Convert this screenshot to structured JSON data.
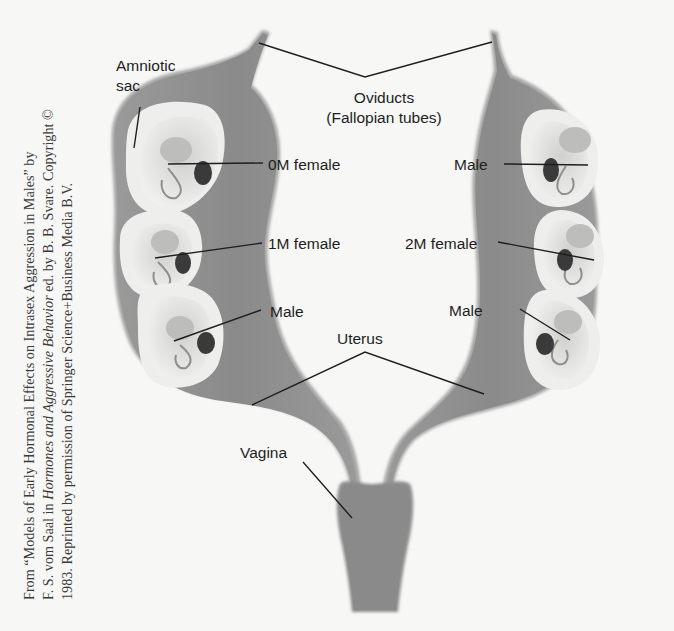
{
  "credit": {
    "line1": "From “Models of Early Hormonal Effects on Intrasex Aggression in Males” by",
    "line2_pre": "F. S. vom Saal in ",
    "line2_italic": "Hormones and Aggressive Behavior",
    "line2_post": " ed. by B. B. Svare. Copyright ©",
    "line3": "1983. Reprinted by permission of Springer Science+Business Media B.V."
  },
  "labels": {
    "amniotic_sac_1": "Amniotic",
    "amniotic_sac_2": "sac",
    "oviducts_1": "Oviducts",
    "oviducts_2": "(Fallopian tubes)",
    "left_top": "0M female",
    "left_mid": "1M female",
    "left_bottom": "Male",
    "right_top": "Male",
    "right_mid": "2M female",
    "right_bottom": "Male",
    "uterus": "Uterus",
    "vagina": "Vagina"
  },
  "colors": {
    "background": "#f7f7f5",
    "tissue": "#8f8f8f",
    "tissue_edge": "#b5b5b5",
    "sac": "#e2e2e0",
    "embryo": "#c9c9c7",
    "ovary": "#3c3c3c",
    "line": "#1e1e1e"
  }
}
